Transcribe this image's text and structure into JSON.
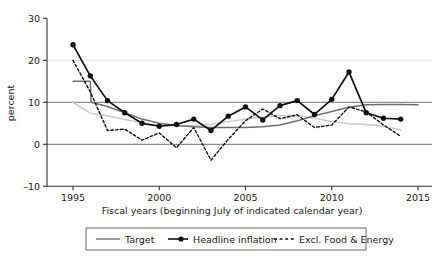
{
  "chart_data": {
    "type": "line",
    "title": "",
    "xlabel": "Fiscal years (beginning July of indicated calendar year)",
    "ylabel": "percent",
    "xlim": [
      1994,
      2015.6
    ],
    "ylim": [
      -13,
      31
    ],
    "xticks": [
      1995,
      2000,
      2005,
      2010,
      2015
    ],
    "xticklabels": [
      "1995",
      "2000",
      "2005",
      "2010",
      "2015"
    ],
    "yticks": [
      -10,
      0,
      10,
      20,
      30
    ],
    "yticklabels": [
      "–10",
      "0",
      "10",
      "20",
      "30"
    ],
    "grid": true,
    "gridlines_y": [
      0,
      10,
      20
    ],
    "legend_position": "below-axis-boxed",
    "series": [
      {
        "name": "Target",
        "style": "solid",
        "color": "#6f6f6f",
        "marker": "none",
        "x": [
          1995,
          1996,
          1996.05,
          1997,
          1998,
          1999,
          2000,
          2001,
          2002,
          2003,
          2004,
          2005,
          2006,
          2007,
          2008,
          2009,
          2010,
          2011,
          2012,
          2013,
          2014,
          2015
        ],
        "y": [
          15.0,
          15.0,
          10.0,
          9.0,
          7.5,
          6.0,
          5.0,
          4.5,
          4.2,
          4.0,
          4.0,
          4.0,
          4.2,
          4.6,
          5.6,
          6.8,
          7.8,
          8.8,
          9.4,
          9.5,
          9.5,
          9.4
        ]
      },
      {
        "name": "Headline inflation",
        "style": "solid",
        "color": "#111111",
        "marker": "circle",
        "x": [
          1995,
          1996,
          1997,
          1998,
          1999,
          2000,
          2001,
          2002,
          2003,
          2004,
          2005,
          2006,
          2007,
          2008,
          2009,
          2010,
          2011,
          2012,
          2013,
          2014
        ],
        "y": [
          23.7,
          16.3,
          10.4,
          7.5,
          5.0,
          4.3,
          4.7,
          6.0,
          3.3,
          6.7,
          8.9,
          5.8,
          9.2,
          10.4,
          7.1,
          10.7,
          17.2,
          7.5,
          6.2,
          6.0
        ]
      },
      {
        "name": "Excl. Food & Energy",
        "style": "dotted",
        "color": "#111111",
        "marker": "none",
        "x": [
          1995,
          1996,
          1997,
          1998,
          1999,
          2000,
          2001,
          2002,
          2003,
          2004,
          2005,
          2006,
          2007,
          2008,
          2009,
          2010,
          2011,
          2012,
          2013,
          2014
        ],
        "y": [
          20.0,
          12.5,
          3.3,
          3.6,
          1.0,
          2.7,
          -0.8,
          4.0,
          -3.8,
          1.2,
          5.6,
          8.4,
          6.1,
          7.0,
          4.0,
          4.6,
          8.9,
          7.7,
          4.6,
          1.9
        ]
      },
      {
        "name": "trend-smooth",
        "style": "solid",
        "color": "#cacaca",
        "marker": "none",
        "x": [
          1995,
          1996,
          1997,
          1998,
          1999,
          2000,
          2001,
          2002,
          2003,
          2004,
          2005,
          2006,
          2007,
          2008,
          2009,
          2010,
          2011,
          2012,
          2013,
          2014
        ],
        "y": [
          10.0,
          7.4,
          6.8,
          5.9,
          5.1,
          4.6,
          4.4,
          4.4,
          4.8,
          5.4,
          6.0,
          6.5,
          6.8,
          6.9,
          6.2,
          5.4,
          4.9,
          4.7,
          4.3,
          3.4
        ]
      }
    ]
  },
  "legend": {
    "items": [
      {
        "label": "Target",
        "marker": "line-solid-gray"
      },
      {
        "label": "Headline inflation",
        "marker": "line-dot-marker"
      },
      {
        "label": "Excl. Food & Energy",
        "marker": "line-dashed"
      }
    ]
  },
  "axes": {
    "y_axis_title": "percent",
    "x_axis_title": "Fiscal years (beginning July of indicated calendar year)"
  }
}
